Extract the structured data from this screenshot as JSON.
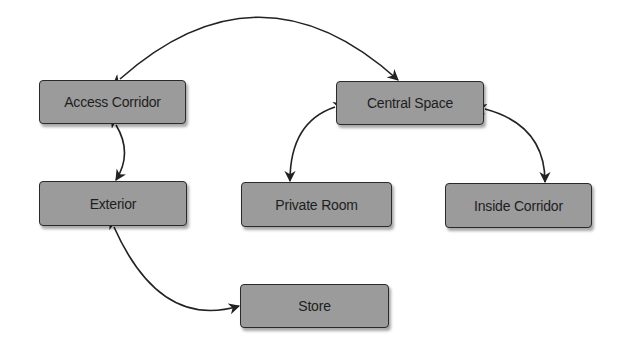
{
  "diagram": {
    "type": "bidirectional-adjacency-diagram",
    "colors": {
      "node_fill": "#9b9b9b",
      "node_border": "#2a2a2a",
      "text": "#1e1e1e",
      "edge": "#222222",
      "background": "#ffffff"
    },
    "nodes": [
      {
        "id": "access_corridor",
        "label": "Access Corridor",
        "x": 39,
        "y": 80,
        "w": 147,
        "h": 44
      },
      {
        "id": "central_space",
        "label": "Central Space",
        "x": 336,
        "y": 81,
        "w": 148,
        "h": 44
      },
      {
        "id": "exterior",
        "label": "Exterior",
        "x": 39,
        "y": 181,
        "w": 148,
        "h": 45
      },
      {
        "id": "private_room",
        "label": "Private Room",
        "x": 241,
        "y": 182,
        "w": 151,
        "h": 45
      },
      {
        "id": "inside_corridor",
        "label": "Inside Corridor",
        "x": 445,
        "y": 183,
        "w": 147,
        "h": 45
      },
      {
        "id": "store",
        "label": "Store",
        "x": 240,
        "y": 284,
        "w": 149,
        "h": 44
      }
    ],
    "edges": [
      {
        "from": "access_corridor",
        "to": "central_space",
        "direction": "both",
        "path": "M 120 79 Q 260 -45 398 80"
      },
      {
        "from": "access_corridor",
        "to": "exterior",
        "direction": "both",
        "path": "M 116 125 Q 133 153 116 180"
      },
      {
        "from": "central_space",
        "to": "private_room",
        "direction": "both",
        "path": "M 335 107 Q 290 122 290 181"
      },
      {
        "from": "central_space",
        "to": "inside_corridor",
        "direction": "both",
        "path": "M 485 109 Q 545 125 545 182"
      },
      {
        "from": "exterior",
        "to": "store",
        "direction": "both",
        "path": "M 114 227 Q 160 330 239 306"
      }
    ]
  }
}
